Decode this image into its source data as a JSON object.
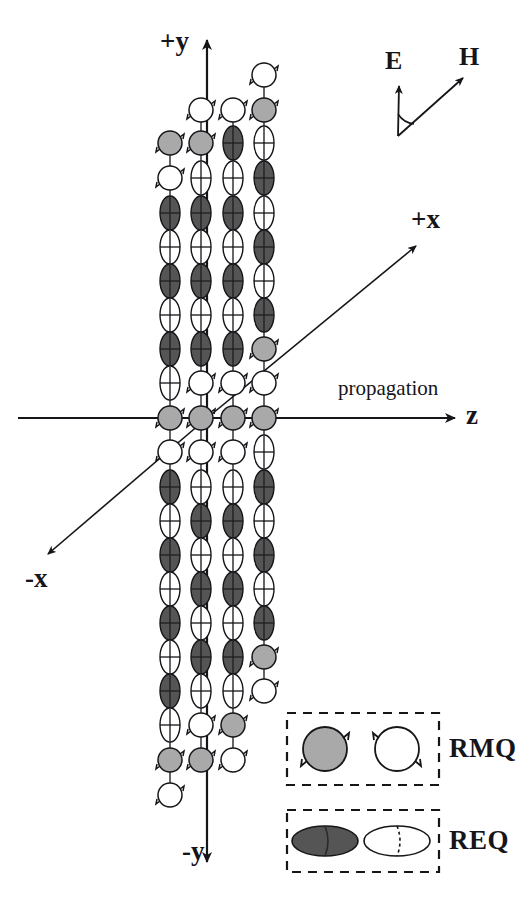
{
  "figure": {
    "background": "#ffffff",
    "ink_color": "#15151a"
  },
  "axes": {
    "y_positive": "+y",
    "y_negative": "-y",
    "x_positive": "+x",
    "x_negative": "-x",
    "z_positive": "z",
    "propagation_label": "propagation",
    "origin": {
      "x": 207,
      "y": 418
    }
  },
  "field_vectors": {
    "electric": "E",
    "magnetic": "H",
    "origin": {
      "x": 398,
      "y": 135
    },
    "e_tip": {
      "x": 399,
      "y": 84
    },
    "h_tip": {
      "x": 466,
      "y": 76
    }
  },
  "legend": {
    "rows": [
      {
        "label": "RMQ",
        "shape": "circle",
        "filled_color": "#a9a9a9",
        "open_color": "#ffffff",
        "description": "rotating magnetic quadrupole"
      },
      {
        "label": "REQ",
        "shape": "ellipse",
        "filled_color": "#555555",
        "open_color": "#ffffff",
        "description": "rotating electric quadrupole"
      }
    ]
  },
  "colors": {
    "gray_fill": "#a9a9a9",
    "dark_fill": "#555555",
    "white_fill": "#ffffff",
    "stroke": "#15151a"
  },
  "chart_data": {
    "type": "scatter",
    "xlabel": "z (propagation)",
    "ylabel": "y",
    "grid": false,
    "legend_position": "bottom-right",
    "columns": [
      {
        "name": "col-1",
        "x": 170
      },
      {
        "name": "col-2",
        "x": 201
      },
      {
        "name": "col-3",
        "x": 233
      },
      {
        "name": "col-4",
        "x": 264
      }
    ],
    "particle_types": [
      "REQ-dark",
      "REQ-open",
      "RMQ-gray",
      "RMQ-open"
    ],
    "series": [
      {
        "name": "col-1",
        "x": 170,
        "items": [
          {
            "y": 143,
            "t": "RMQ-gray"
          },
          {
            "y": 178,
            "t": "RMQ-open"
          },
          {
            "y": 213,
            "t": "REQ-dark"
          },
          {
            "y": 247,
            "t": "REQ-open"
          },
          {
            "y": 281,
            "t": "REQ-dark"
          },
          {
            "y": 315,
            "t": "REQ-open"
          },
          {
            "y": 349,
            "t": "REQ-dark"
          },
          {
            "y": 383,
            "t": "REQ-open"
          },
          {
            "y": 418,
            "t": "RMQ-gray"
          },
          {
            "y": 452,
            "t": "RMQ-open"
          },
          {
            "y": 487,
            "t": "REQ-dark"
          },
          {
            "y": 521,
            "t": "REQ-open"
          },
          {
            "y": 555,
            "t": "REQ-dark"
          },
          {
            "y": 589,
            "t": "REQ-open"
          },
          {
            "y": 623,
            "t": "REQ-dark"
          },
          {
            "y": 657,
            "t": "REQ-open"
          },
          {
            "y": 691,
            "t": "REQ-dark"
          },
          {
            "y": 725,
            "t": "REQ-open"
          },
          {
            "y": 760,
            "t": "RMQ-gray"
          },
          {
            "y": 795,
            "t": "RMQ-open"
          }
        ]
      },
      {
        "name": "col-2",
        "x": 201,
        "items": [
          {
            "y": 110,
            "t": "RMQ-open"
          },
          {
            "y": 143,
            "t": "RMQ-gray"
          },
          {
            "y": 178,
            "t": "REQ-open"
          },
          {
            "y": 213,
            "t": "REQ-dark"
          },
          {
            "y": 247,
            "t": "REQ-open"
          },
          {
            "y": 281,
            "t": "REQ-dark"
          },
          {
            "y": 315,
            "t": "REQ-open"
          },
          {
            "y": 349,
            "t": "REQ-dark"
          },
          {
            "y": 383,
            "t": "RMQ-open"
          },
          {
            "y": 418,
            "t": "RMQ-gray"
          },
          {
            "y": 452,
            "t": "RMQ-open"
          },
          {
            "y": 487,
            "t": "REQ-open"
          },
          {
            "y": 521,
            "t": "REQ-dark"
          },
          {
            "y": 555,
            "t": "REQ-open"
          },
          {
            "y": 589,
            "t": "REQ-dark"
          },
          {
            "y": 623,
            "t": "REQ-open"
          },
          {
            "y": 657,
            "t": "REQ-dark"
          },
          {
            "y": 691,
            "t": "REQ-open"
          },
          {
            "y": 725,
            "t": "RMQ-open"
          },
          {
            "y": 760,
            "t": "RMQ-gray"
          }
        ]
      },
      {
        "name": "col-3",
        "x": 233,
        "items": [
          {
            "y": 110,
            "t": "RMQ-open"
          },
          {
            "y": 143,
            "t": "REQ-dark"
          },
          {
            "y": 178,
            "t": "REQ-open"
          },
          {
            "y": 213,
            "t": "REQ-dark"
          },
          {
            "y": 247,
            "t": "REQ-open"
          },
          {
            "y": 281,
            "t": "REQ-dark"
          },
          {
            "y": 315,
            "t": "REQ-open"
          },
          {
            "y": 349,
            "t": "REQ-dark"
          },
          {
            "y": 383,
            "t": "RMQ-open"
          },
          {
            "y": 418,
            "t": "RMQ-gray"
          },
          {
            "y": 452,
            "t": "RMQ-open"
          },
          {
            "y": 487,
            "t": "REQ-open"
          },
          {
            "y": 521,
            "t": "REQ-dark"
          },
          {
            "y": 555,
            "t": "REQ-open"
          },
          {
            "y": 589,
            "t": "REQ-dark"
          },
          {
            "y": 623,
            "t": "REQ-open"
          },
          {
            "y": 657,
            "t": "REQ-dark"
          },
          {
            "y": 691,
            "t": "REQ-open"
          },
          {
            "y": 725,
            "t": "RMQ-gray"
          },
          {
            "y": 760,
            "t": "RMQ-open"
          }
        ]
      },
      {
        "name": "col-4",
        "x": 264,
        "items": [
          {
            "y": 75,
            "t": "RMQ-open"
          },
          {
            "y": 110,
            "t": "RMQ-gray"
          },
          {
            "y": 143,
            "t": "REQ-open"
          },
          {
            "y": 178,
            "t": "REQ-dark"
          },
          {
            "y": 213,
            "t": "REQ-open"
          },
          {
            "y": 247,
            "t": "REQ-dark"
          },
          {
            "y": 281,
            "t": "REQ-open"
          },
          {
            "y": 315,
            "t": "REQ-dark"
          },
          {
            "y": 349,
            "t": "RMQ-gray"
          },
          {
            "y": 383,
            "t": "RMQ-open"
          },
          {
            "y": 418,
            "t": "RMQ-gray"
          },
          {
            "y": 452,
            "t": "REQ-open"
          },
          {
            "y": 487,
            "t": "REQ-dark"
          },
          {
            "y": 521,
            "t": "REQ-open"
          },
          {
            "y": 555,
            "t": "REQ-dark"
          },
          {
            "y": 589,
            "t": "REQ-open"
          },
          {
            "y": 623,
            "t": "REQ-dark"
          },
          {
            "y": 657,
            "t": "RMQ-gray"
          },
          {
            "y": 691,
            "t": "RMQ-open"
          }
        ]
      }
    ]
  }
}
